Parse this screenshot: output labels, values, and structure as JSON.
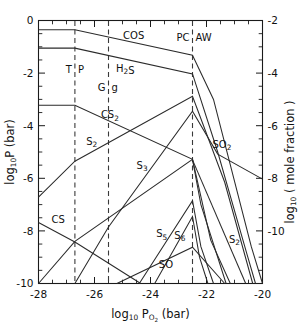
{
  "chart_data": {
    "type": "line",
    "title": "",
    "xlabel": "log10 PO2 (bar)",
    "ylabel": "log10 P (bar)",
    "ylabel_right": "log10 (mole fraction)",
    "xlim": [
      -28,
      -20
    ],
    "ylim": [
      -10,
      0
    ],
    "ylim_right": [
      -12,
      -2
    ],
    "grid": false,
    "legend": "inline-annotations",
    "xticks": [
      -28,
      -26,
      -24,
      -22,
      -20
    ],
    "xticklabels": [
      "-28",
      "-26",
      "-24",
      "-22",
      "-20"
    ],
    "yticks": [
      0,
      -2,
      -4,
      -6,
      -8,
      -10
    ],
    "yticklabels": [
      "0",
      "-2",
      "-4",
      "-6",
      "-8",
      "-10"
    ],
    "yticks_right": [
      -2,
      -4,
      -6,
      -8,
      -10
    ],
    "yticklabels_right": [
      "-2",
      "-4",
      "-6",
      "-8",
      "-10"
    ],
    "xtick_minor_step": 0.5,
    "ytick_minor_step": 0.5,
    "vertical_markers": [
      {
        "name": "TP",
        "label_left": "T",
        "label_right": "P",
        "x": -26.7
      },
      {
        "name": "Gg",
        "label_left": "G",
        "label_right": "g",
        "x": -25.5
      },
      {
        "name": "PCAW",
        "label_left": "PC",
        "label_right": "AW",
        "x": -22.5
      }
    ],
    "series": [
      {
        "name": "COS",
        "label": "COS",
        "label_x": -24.6,
        "label_y": -0.72,
        "points": [
          [
            -28,
            -0.35
          ],
          [
            -26.7,
            -0.35
          ],
          [
            -22.5,
            -1.32
          ],
          [
            -21.75,
            -3.0
          ],
          [
            -20.4,
            -8.6
          ],
          [
            -20.0,
            -10.0
          ]
        ]
      },
      {
        "name": "H2S",
        "label": "H2S",
        "label_x": -24.9,
        "label_y": -1.95,
        "points": [
          [
            -28,
            -1.05
          ],
          [
            -26.7,
            -1.05
          ],
          [
            -22.5,
            -2.03
          ],
          [
            -21.6,
            -5.0
          ],
          [
            -20.55,
            -8.9
          ],
          [
            -20.25,
            -10.0
          ]
        ]
      },
      {
        "name": "CS2",
        "label": "CS2",
        "label_x": -25.45,
        "label_y": -3.72,
        "points": [
          [
            -28,
            -3.22
          ],
          [
            -26.7,
            -3.22
          ],
          [
            -22.5,
            -5.28
          ],
          [
            -22.2,
            -7.0
          ],
          [
            -21.3,
            -10.0
          ]
        ]
      },
      {
        "name": "S2_upper",
        "label": "S2",
        "label_x": -26.1,
        "label_y": -4.72,
        "points": [
          [
            -28,
            -6.72
          ],
          [
            -26.7,
            -5.35
          ],
          [
            -22.5,
            -2.88
          ],
          [
            -21.35,
            -6.15
          ],
          [
            -20.35,
            -10.0
          ]
        ]
      },
      {
        "name": "SO2",
        "label": "SO2",
        "label_x": -21.45,
        "label_y": -4.85,
        "points": [
          [
            -26.7,
            -10.0
          ],
          [
            -25.5,
            -7.85
          ],
          [
            -22.5,
            -3.45
          ],
          [
            -21.6,
            -5.08
          ],
          [
            -20.0,
            -6.03
          ]
        ]
      },
      {
        "name": "S3",
        "label": "S3",
        "label_x": -24.3,
        "label_y": -5.65,
        "points": [
          [
            -28,
            -10.0
          ],
          [
            -26.7,
            -8.4
          ],
          [
            -22.5,
            -5.28
          ],
          [
            -21.85,
            -8.35
          ],
          [
            -21.15,
            -10.0
          ]
        ]
      },
      {
        "name": "CS",
        "label": "CS",
        "label_x": -27.3,
        "label_y": -7.7,
        "points": [
          [
            -28,
            -7.68
          ],
          [
            -26.7,
            -8.42
          ],
          [
            -24.35,
            -10.0
          ]
        ]
      },
      {
        "name": "S5",
        "label": "S5",
        "label_x": -23.6,
        "label_y": -8.25,
        "points": [
          [
            -24.4,
            -10.0
          ],
          [
            -22.5,
            -6.85
          ],
          [
            -22.2,
            -8.6
          ],
          [
            -21.75,
            -10.0
          ]
        ]
      },
      {
        "name": "S6",
        "label": "S6",
        "label_x": -22.95,
        "label_y": -8.3,
        "points": [
          [
            -23.85,
            -10.0
          ],
          [
            -22.5,
            -7.45
          ],
          [
            -22.25,
            -9.0
          ],
          [
            -21.95,
            -10.0
          ]
        ]
      },
      {
        "name": "SO",
        "label": "SO",
        "label_x": -23.45,
        "label_y": -9.4,
        "points": [
          [
            -25.2,
            -10.0
          ],
          [
            -22.5,
            -8.62
          ],
          [
            -21.35,
            -10.0
          ]
        ]
      },
      {
        "name": "S2_lower",
        "label": "S2",
        "label_x": -21.0,
        "label_y": -8.45,
        "points": [
          [
            -22.5,
            -5.3
          ],
          [
            -20.6,
            -10.0
          ]
        ]
      }
    ]
  }
}
